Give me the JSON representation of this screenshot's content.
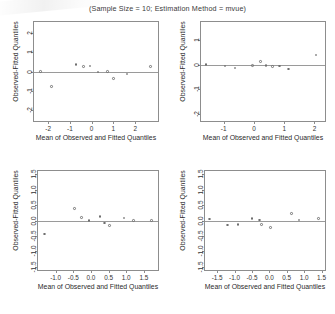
{
  "figure": {
    "title": "(Sample Size = 10; Estimation Method = mvue)",
    "axis_title_x": "Mean of Observed and Fitted Quantiles",
    "axis_title_y": "Observed-Fitted Quantiles"
  },
  "chart_data": [
    {
      "id": "panel-tl",
      "type": "scatter",
      "title": "",
      "xlabel": "Mean of Observed and Fitted Quantiles",
      "ylabel": "Observed-Fitted Quantiles",
      "xlim": [
        -2.65,
        3.05
      ],
      "ylim": [
        -2.6,
        2.6
      ],
      "xticks": [
        -2,
        -1,
        0,
        1,
        2
      ],
      "xticklabels": [
        "-2",
        "-1",
        "0",
        "1",
        "2"
      ],
      "yticks": [
        -2,
        -1,
        0,
        1,
        2
      ],
      "yticklabels": [
        "-2",
        "-1",
        "0",
        "1",
        "2"
      ],
      "grid": false,
      "reference_line_y": 0,
      "x": [
        -2.35,
        -1.85,
        -0.72,
        -0.38,
        -0.08,
        0.3,
        0.72,
        1.0,
        1.62,
        2.7
      ],
      "y": [
        0.0,
        -0.78,
        0.38,
        0.26,
        0.29,
        -0.03,
        -0.01,
        -0.38,
        -0.14,
        0.25
      ]
    },
    {
      "id": "panel-tr",
      "type": "scatter",
      "title": "",
      "xlabel": "Mean of Observed and Fitted Quantiles",
      "ylabel": "Observed-Fitted Quantiles",
      "xlim": [
        -1.75,
        2.35
      ],
      "ylim": [
        -2.3,
        1.75
      ],
      "xticks": [
        -1,
        0,
        1,
        2
      ],
      "xticklabels": [
        "-1",
        "0",
        "1",
        "2"
      ],
      "yticks": [
        -2,
        -1,
        0,
        1
      ],
      "yticklabels": [
        "-2",
        "-1",
        "0",
        "1"
      ],
      "grid": false,
      "reference_line_y": 0,
      "x": [
        -1.58,
        -0.95,
        -0.62,
        -0.05,
        0.22,
        0.4,
        0.62,
        0.85,
        1.15,
        2.05
      ],
      "y": [
        0.0,
        -0.05,
        -0.13,
        -0.03,
        0.14,
        -0.02,
        -0.06,
        -0.05,
        -0.18,
        0.4
      ]
    },
    {
      "id": "panel-bl",
      "type": "scatter",
      "title": "",
      "xlabel": "Mean of Observed and Fitted Quantiles",
      "ylabel": "Observed-Fitted Quantiles",
      "xlim": [
        -1.5,
        1.9
      ],
      "ylim": [
        -1.6,
        1.6
      ],
      "xticks": [
        -1.0,
        -0.5,
        0.0,
        0.5,
        1.0,
        1.5
      ],
      "xticklabels": [
        "-1.0",
        "-0.5",
        "0.0",
        "0.5",
        "1.0",
        "1.5"
      ],
      "yticks": [
        -1.5,
        -1.0,
        -0.5,
        0.0,
        0.5,
        1.0,
        1.5
      ],
      "yticklabels": [
        "-1.5",
        "-1.0",
        "-0.5",
        "0.0",
        "0.5",
        "1.0",
        "1.5"
      ],
      "grid": false,
      "reference_line_y": 0,
      "x": [
        -1.32,
        -0.47,
        -0.27,
        -0.06,
        0.26,
        0.38,
        0.52,
        0.94,
        1.2,
        1.72
      ],
      "y": [
        -0.44,
        0.38,
        0.1,
        0.0,
        0.12,
        -0.08,
        -0.16,
        0.08,
        0.0,
        0.0
      ]
    },
    {
      "id": "panel-br",
      "type": "scatter",
      "title": "",
      "xlabel": "Mean of Observed and Fitted Quantiles",
      "ylabel": "Observed-Fitted Quantiles",
      "xlim": [
        -1.85,
        1.6
      ],
      "ylim": [
        -1.6,
        1.6
      ],
      "xticks": [
        -1.5,
        -1.0,
        -0.5,
        0.0,
        0.5,
        1.0,
        1.5
      ],
      "xticklabels": [
        "-1.5",
        "-1.0",
        "-0.5",
        "0.0",
        "0.5",
        "1.0",
        "1.5"
      ],
      "yticks": [
        -1.5,
        -1.0,
        -0.5,
        0.0,
        0.5,
        1.0,
        1.5
      ],
      "yticklabels": [
        "-1.5",
        "-1.0",
        "-0.5",
        "0.0",
        "0.5",
        "1.0",
        "1.5"
      ],
      "grid": false,
      "reference_line_y": 0,
      "x": [
        -1.72,
        -1.2,
        -0.9,
        -0.5,
        -0.28,
        -0.22,
        0.03,
        0.63,
        0.85,
        1.42
      ],
      "y": [
        0.05,
        -0.14,
        -0.12,
        0.07,
        0.02,
        -0.12,
        -0.22,
        0.22,
        0.02,
        0.07
      ]
    }
  ]
}
